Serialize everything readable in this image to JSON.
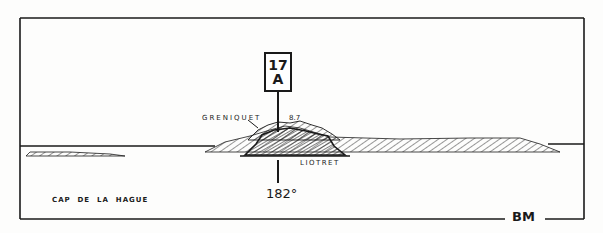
{
  "drawing": {
    "type": "coastal view / leading line sketch",
    "beacon": {
      "number": "17",
      "letter": "A"
    },
    "labels": {
      "greniquet": "GRENIQUET",
      "height": "8.7",
      "liotret": "LIOTRET",
      "bearing": "182°",
      "cap": "CAP  DE  LA  HAGUE",
      "signature": "BM"
    },
    "colors": {
      "ink": "#1a1a1a",
      "paper": "#fdfdfc"
    }
  }
}
